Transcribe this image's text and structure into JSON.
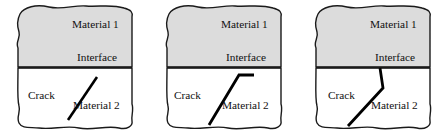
{
  "figure": {
    "type": "diagram",
    "panel_count": 3,
    "colors": {
      "material1_fill": "#dcdcdc",
      "material2_fill": "#ffffff",
      "outline": "#1a1a1a",
      "crack": "#000000",
      "background": "#ffffff",
      "text": "#111111"
    },
    "labels": {
      "material1": "Material 1",
      "material2": "Material 2",
      "interface": "Interface",
      "crack": "Crack"
    },
    "panels": [
      {
        "id": "panel-1",
        "name": "crack-approaching-interface",
        "material1_label": "Material 1",
        "interface_label": "Interface",
        "crack_label": "Crack",
        "material2_label": "Material 2",
        "crack_geometry": "single straight inclined crack in Material 2 terminating below the interface"
      },
      {
        "id": "panel-2",
        "name": "crack-deflected-along-interface",
        "material1_label": "Material 1",
        "interface_label": "Interface",
        "crack_label": "Crack",
        "material2_label": "Material 2",
        "crack_geometry": "inclined crack reaching the interface then deflecting horizontally along it"
      },
      {
        "id": "panel-3",
        "name": "crack-penetrating-interface",
        "material1_label": "Material 1",
        "interface_label": "Interface",
        "crack_label": "Crack",
        "material2_label": "Material 2",
        "crack_geometry": "kinked crack running from the interface down through Material 2 to the lower edge"
      }
    ]
  }
}
